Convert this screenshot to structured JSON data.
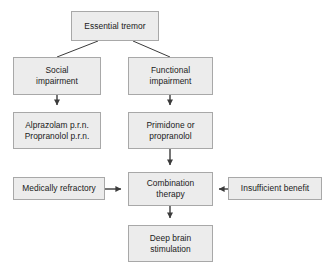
{
  "diagram": {
    "style": {
      "node_fill": "#ececec",
      "node_border": "#a8a8a8",
      "edge_color": "#3b3b3b",
      "text_color": "#1a1a1a",
      "background": "#ffffff"
    },
    "nodes": [
      {
        "id": "essential-tremor",
        "label": "Essential tremor"
      },
      {
        "id": "social-impairment",
        "label": "Social\nimpairment"
      },
      {
        "id": "functional-impairment",
        "label": "Functional\nimpairment"
      },
      {
        "id": "alprazolam",
        "label": "Alprazolam p.r.n.\nPropranolol p.r.n."
      },
      {
        "id": "primidone",
        "label": "Primidone or\npropranolol"
      },
      {
        "id": "medically-refractory",
        "label": "Medically refractory"
      },
      {
        "id": "combination-therapy",
        "label": "Combination\ntherapy"
      },
      {
        "id": "insufficient-benefit",
        "label": "Insufficient benefit"
      },
      {
        "id": "deep-brain-stimulation",
        "label": "Deep brain\nstimulation"
      }
    ],
    "edges": [
      {
        "from": "essential-tremor",
        "to": "social-impairment",
        "kind": "line",
        "direction": "diagonal-left"
      },
      {
        "from": "essential-tremor",
        "to": "functional-impairment",
        "kind": "line",
        "direction": "diagonal-right"
      },
      {
        "from": "social-impairment",
        "to": "alprazolam",
        "kind": "arrow",
        "direction": "down"
      },
      {
        "from": "functional-impairment",
        "to": "primidone",
        "kind": "arrow",
        "direction": "down"
      },
      {
        "from": "primidone",
        "to": "combination-therapy",
        "kind": "arrow",
        "direction": "down"
      },
      {
        "from": "medically-refractory",
        "to": "combination-therapy",
        "kind": "arrow",
        "direction": "right"
      },
      {
        "from": "insufficient-benefit",
        "to": "combination-therapy",
        "kind": "arrow",
        "direction": "left"
      },
      {
        "from": "combination-therapy",
        "to": "deep-brain-stimulation",
        "kind": "arrow",
        "direction": "down"
      }
    ]
  }
}
